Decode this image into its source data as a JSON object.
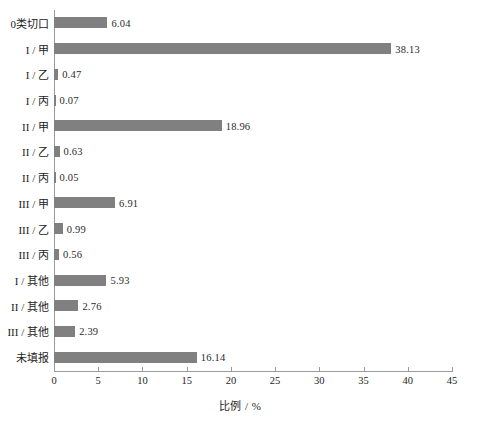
{
  "chart_data": {
    "type": "bar",
    "orientation": "horizontal",
    "title": "",
    "xlabel": "比例 / %",
    "ylabel": "",
    "xlim": [
      0,
      45
    ],
    "xticks": [
      "0",
      "5",
      "10",
      "15",
      "20",
      "25",
      "30",
      "35",
      "40",
      "45"
    ],
    "grid": false,
    "legend": false,
    "bar_color": "#808080",
    "axis_color": "#9a9a9a",
    "categories": [
      "0类切口",
      "I / 甲",
      "I / 乙",
      "I / 丙",
      "II / 甲",
      "II / 乙",
      "II / 丙",
      "III / 甲",
      "III / 乙",
      "III / 丙",
      "I / 其他",
      "II / 其他",
      "III / 其他",
      "未填报"
    ],
    "values": [
      6.04,
      38.13,
      0.47,
      0.07,
      18.96,
      0.63,
      0.05,
      6.91,
      0.99,
      0.56,
      5.93,
      2.76,
      2.39,
      16.14
    ],
    "value_labels": [
      "6.04",
      "38.13",
      "0.47",
      "0.07",
      "18.96",
      "0.63",
      "0.05",
      "6.91",
      "0.99",
      "0.56",
      "5.93",
      "2.76",
      "2.39",
      "16.14"
    ]
  }
}
